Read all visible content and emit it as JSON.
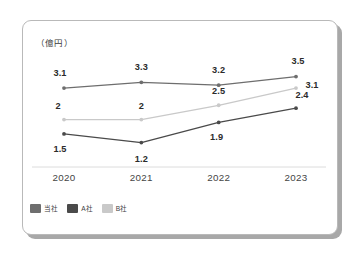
{
  "unit_label": "（億円）",
  "legend": {
    "position": "bottom-left",
    "items": [
      {
        "label": "当社",
        "color": "#6e6e6e",
        "name": "our-company"
      },
      {
        "label": "A社",
        "color": "#4a4a4a",
        "name": "company-a"
      },
      {
        "label": "B社",
        "color": "#c9c9c9",
        "name": "company-b"
      }
    ]
  },
  "axis": {
    "x_ticks": [
      "2020",
      "2021",
      "2022",
      "2023"
    ],
    "y_min": 0.8,
    "y_max": 3.8,
    "grid": false,
    "x_axis_line_color": "#d9d9d9"
  },
  "chart_data": {
    "type": "line",
    "title": "",
    "subtitle": "",
    "xlabel": "",
    "ylabel": "億円",
    "categories": [
      "2020",
      "2021",
      "2022",
      "2023"
    ],
    "ylim": [
      0.8,
      3.8
    ],
    "grid": false,
    "legend_position": "bottom-left",
    "annotations": [
      "（億円）"
    ],
    "series": [
      {
        "name": "当社",
        "color": "#6e6e6e",
        "values": [
          3.1,
          3.3,
          3.2,
          3.5
        ],
        "labels": [
          "3.1",
          "3.3",
          "3.2",
          "3.5"
        ]
      },
      {
        "name": "A社",
        "color": "#4a4a4a",
        "values": [
          1.5,
          1.2,
          1.9,
          2.4
        ],
        "labels": [
          "1.5",
          "1.2",
          "1.9",
          "2.4"
        ]
      },
      {
        "name": "B社",
        "color": "#c9c9c9",
        "values": [
          2.0,
          2.0,
          2.5,
          3.1
        ],
        "labels": [
          "2",
          "2",
          "2.5",
          "3.1"
        ]
      }
    ]
  },
  "point_labels": {
    "ours": [
      "3.1",
      "3.3",
      "3.2",
      "3.5"
    ],
    "a": [
      "1.5",
      "1.2",
      "1.9",
      "2.4"
    ],
    "b": [
      "2",
      "2",
      "2.5",
      "3.1"
    ]
  }
}
